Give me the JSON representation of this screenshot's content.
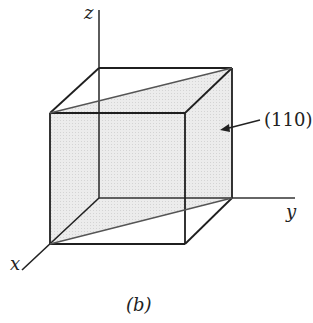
{
  "diagram": {
    "type": "crystal-plane-unit-cube",
    "axes": {
      "x": "x",
      "y": "y",
      "z": "z"
    },
    "plane_label": "(110)",
    "caption": "(b)",
    "colors": {
      "plane_fill": "#e6e6e6",
      "line": "#222222",
      "plane_edge": "#555555"
    }
  }
}
